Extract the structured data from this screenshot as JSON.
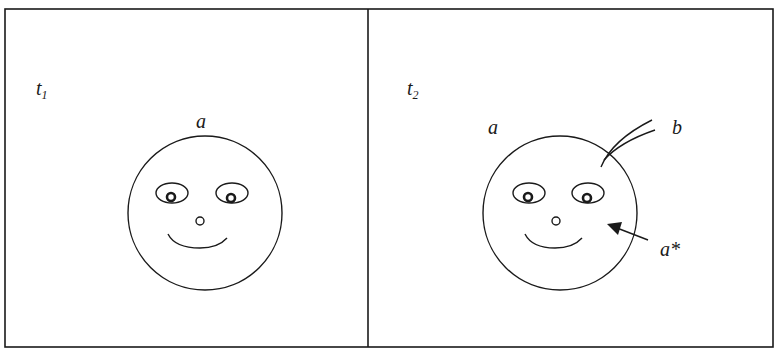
{
  "figure": {
    "colors": {
      "stroke": "#1a1a1a",
      "background": "#ffffff"
    },
    "panels": [
      {
        "id": "left",
        "time_label": {
          "base": "t",
          "subscript": "1"
        },
        "face_label": "a",
        "face": {
          "eyes": 2,
          "nose": true,
          "smile": true
        }
      },
      {
        "id": "right",
        "time_label": {
          "base": "t",
          "subscript": "2"
        },
        "face_label": "a",
        "intruder_label": "b",
        "arrow_label": "a*",
        "face": {
          "eyes": 2,
          "nose": true,
          "smile": true
        },
        "annotations": [
          "b: two curved lines piercing the circle boundary",
          "a*: arrow pointing to interior of face"
        ]
      }
    ]
  }
}
